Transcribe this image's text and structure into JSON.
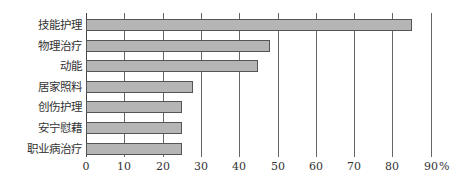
{
  "chart_data": {
    "type": "bar",
    "orientation": "horizontal",
    "title": "",
    "xlabel": "%",
    "ylabel": "",
    "categories": [
      "技能护理",
      "物理治疗",
      "动能",
      "居家照料",
      "创伤护理",
      "安宁慰藉",
      "职业病治疗"
    ],
    "values": [
      85,
      48,
      45,
      28,
      25,
      25,
      25
    ],
    "xlim": [
      0,
      90
    ],
    "xticks": [
      0,
      10,
      20,
      30,
      40,
      50,
      60,
      70,
      80,
      90
    ],
    "xtick_labels": [
      "0",
      "10",
      "20",
      "30",
      "40",
      "50",
      "60",
      "70",
      "80",
      "90"
    ],
    "unit_label": "%",
    "grid": "vertical",
    "legend": null,
    "colors": {
      "bar_fill": "#b5b5b5",
      "bar_border": "#555555",
      "grid": "#666666"
    }
  }
}
